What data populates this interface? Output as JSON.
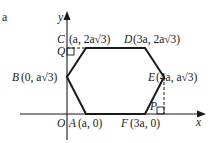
{
  "part_label": "a",
  "axes": {
    "x_label": "x",
    "y_label": "y",
    "origin_label": "O"
  },
  "points": {
    "A": {
      "name": "A",
      "coords": "(a, 0)"
    },
    "B": {
      "name": "B",
      "coords": "(0, a√3)"
    },
    "C": {
      "name": "C",
      "coords": "(a, 2a√3)"
    },
    "D": {
      "name": "D",
      "coords": "(3a, 2a√3)"
    },
    "E": {
      "name": "E",
      "coords": "(4a, a√3)"
    },
    "F": {
      "name": "F",
      "coords": "(3a, 0)"
    }
  },
  "auxiliary_points": {
    "Q": "Q",
    "P": "P"
  },
  "colors": {
    "stroke": "#1a1a1a",
    "background": "#ffffff"
  }
}
